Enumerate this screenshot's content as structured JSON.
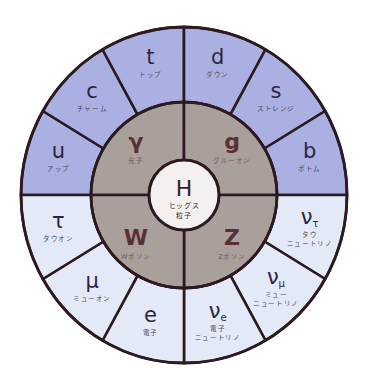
{
  "diagram": {
    "title": "Standard Model particles",
    "colors": {
      "quark": "#aab1e2",
      "lepton": "#e4e9f7",
      "boson": "#a99f9b",
      "higgs": "#f3f0ef",
      "outline": "#2c1a20"
    },
    "geometry": {
      "cx": 184,
      "cy": 195,
      "outer_rx": 163,
      "outer_ry": 168,
      "boson_r": 93,
      "higgs_r": 35
    },
    "quarks": [
      {
        "symbol": "u",
        "name": "アップ",
        "start_deg": 180,
        "end_deg": 150
      },
      {
        "symbol": "c",
        "name": "チャーム",
        "start_deg": 150,
        "end_deg": 120
      },
      {
        "symbol": "t",
        "name": "トップ",
        "start_deg": 120,
        "end_deg": 90
      },
      {
        "symbol": "d",
        "name": "ダウン",
        "start_deg": 90,
        "end_deg": 60
      },
      {
        "symbol": "s",
        "name": "ストレンジ",
        "start_deg": 60,
        "end_deg": 30
      },
      {
        "symbol": "b",
        "name": "ボトム",
        "start_deg": 30,
        "end_deg": 0
      }
    ],
    "leptons": [
      {
        "symbol": "ν",
        "index": "τ",
        "name": "タウ",
        "name2": "ニュートリノ",
        "start_deg": 0,
        "end_deg": -30
      },
      {
        "symbol": "ν",
        "index": "μ",
        "name": "ミュー",
        "name2": "ニュートリノ",
        "start_deg": -30,
        "end_deg": -60
      },
      {
        "symbol": "ν",
        "index": "e",
        "name": "電子",
        "name2": "ニュートリノ",
        "start_deg": -60,
        "end_deg": -90
      },
      {
        "symbol": "e",
        "index": "",
        "name": "電子",
        "name2": "",
        "start_deg": -90,
        "end_deg": -120
      },
      {
        "symbol": "μ",
        "index": "",
        "name": "ミューオン",
        "name2": "",
        "start_deg": -120,
        "end_deg": -150
      },
      {
        "symbol": "τ",
        "index": "",
        "name": "タウオン",
        "name2": "",
        "start_deg": -150,
        "end_deg": -180
      }
    ],
    "bosons": [
      {
        "symbol": "γ",
        "name": "光子",
        "start_deg": 180,
        "end_deg": 90
      },
      {
        "symbol": "g",
        "name": "グルーオン",
        "start_deg": 90,
        "end_deg": 0
      },
      {
        "symbol": "Z",
        "name": "Zボソン",
        "start_deg": 0,
        "end_deg": -90
      },
      {
        "symbol": "W",
        "name": "Wボソン",
        "start_deg": -90,
        "end_deg": -180
      }
    ],
    "higgs": {
      "symbol": "H",
      "name_line1": "ヒッグス",
      "name_line2": "粒子"
    }
  }
}
